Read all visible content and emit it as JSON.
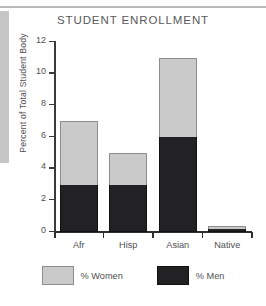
{
  "chart_data": {
    "type": "bar",
    "subtype": "stacked-bar",
    "title": "STUDENT ENROLLMENT",
    "xlabel": "",
    "ylabel": "Percent of Total Student Body",
    "categories": [
      "Afr",
      "Hisp",
      "Asian",
      "Native"
    ],
    "series": [
      {
        "name": "% Men",
        "color": "#222224",
        "values": [
          3,
          3,
          6,
          0.2
        ]
      },
      {
        "name": "% Women",
        "color": "#cacaca",
        "values": [
          4,
          2,
          5,
          0.2
        ]
      }
    ],
    "totals": [
      7,
      5,
      11,
      0.4
    ],
    "ylim": [
      0,
      12
    ],
    "yticks": [
      0,
      2,
      4,
      6,
      8,
      10,
      12
    ],
    "ytick_labels": [
      "0",
      "2",
      "4",
      "6",
      "8",
      "10",
      "12"
    ],
    "grid": false,
    "legend_position": "bottom"
  },
  "legend": {
    "entries": [
      {
        "label": "% Women",
        "swatch": "light-gray-swatch"
      },
      {
        "label": "% Men",
        "swatch": "dark-swatch"
      }
    ]
  },
  "artifacts": {
    "top_rule_color": "#b9b9b9",
    "left_scan_bar_color": "#c6c6c6"
  }
}
